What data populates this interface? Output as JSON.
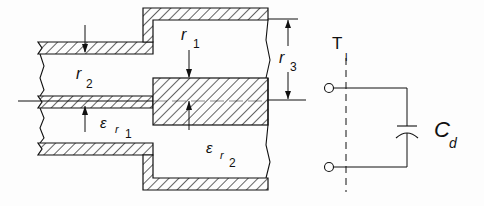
{
  "diagram": {
    "labels": {
      "r1": {
        "main": "r",
        "sub": "1"
      },
      "r2": {
        "main": "r",
        "sub": "2"
      },
      "r3": {
        "main": "r",
        "sub": "3"
      },
      "er1": {
        "main": "ε",
        "sub1": "r",
        "sub2": "1"
      },
      "er2": {
        "main": "ε",
        "sub1": "r",
        "sub2": "2"
      },
      "t1": {
        "main": "T",
        "sub": "l"
      },
      "cd": {
        "main": "C",
        "sub": "d"
      }
    },
    "components": [
      "small coaxial line",
      "large coaxial line",
      "reference plane T1",
      "discontinuity capacitance Cd"
    ],
    "colors": {
      "line": "#111111",
      "background": "#fdfdfd"
    }
  }
}
